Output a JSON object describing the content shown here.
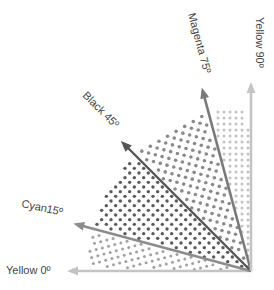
{
  "screens": [
    {
      "name": "Yellow",
      "angle_deg": 0,
      "label": "Yellow 0º",
      "arrow_color": "#c4c4c4",
      "dot_color": "#b8b8b8"
    },
    {
      "name": "Cyan",
      "angle_deg": 15,
      "label": "Cyan15º",
      "arrow_color": "#8c8c8c",
      "dot_color": "#a2a2a2"
    },
    {
      "name": "Black",
      "angle_deg": 45,
      "label": "Black 45º",
      "arrow_color": "#555555",
      "dot_color": "#5a5a5a"
    },
    {
      "name": "Magenta",
      "angle_deg": 75,
      "label": "Magenta 75º",
      "arrow_color": "#7a7a7a",
      "dot_color": "#8a8a8a"
    },
    {
      "name": "Yellow",
      "angle_deg": 90,
      "label": "Yellow 90º",
      "arrow_color": "#c4c4c4",
      "dot_color": "#c2c2c2"
    }
  ],
  "sectors": [
    {
      "name": "cyan-sector",
      "from_deg": 0,
      "to_deg": 15,
      "screen_angle_deg": 15,
      "dot_color": "#a2a2a2"
    },
    {
      "name": "black-sector",
      "from_deg": 15,
      "to_deg": 45,
      "screen_angle_deg": 45,
      "dot_color": "#5a5a5a"
    },
    {
      "name": "magenta-sector",
      "from_deg": 45,
      "to_deg": 75,
      "screen_angle_deg": 75,
      "dot_color": "#8a8a8a"
    },
    {
      "name": "yellow-sector",
      "from_deg": 75,
      "to_deg": 90,
      "screen_angle_deg": 0,
      "dot_color": "#c2c2c2"
    }
  ]
}
